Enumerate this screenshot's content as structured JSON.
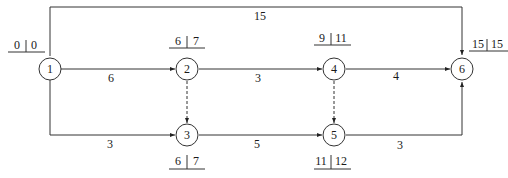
{
  "diagram": {
    "type": "activity-on-arrow network",
    "nodes": [
      {
        "id": "1",
        "label": "1",
        "x": 50,
        "y": 69,
        "es": "0",
        "ls": "0",
        "time_pos": "above-left"
      },
      {
        "id": "2",
        "label": "2",
        "x": 187,
        "y": 69,
        "es": "6",
        "ls": "7",
        "time_pos": "above"
      },
      {
        "id": "3",
        "label": "3",
        "x": 187,
        "y": 135,
        "es": "6",
        "ls": "7",
        "time_pos": "below"
      },
      {
        "id": "4",
        "label": "4",
        "x": 334,
        "y": 69,
        "es": "9",
        "ls": "11",
        "time_pos": "above"
      },
      {
        "id": "5",
        "label": "5",
        "x": 334,
        "y": 135,
        "es": "11",
        "ls": "12",
        "time_pos": "below"
      },
      {
        "id": "6",
        "label": "6",
        "x": 462,
        "y": 69,
        "es": "15",
        "ls": "15",
        "time_pos": "above-right"
      }
    ],
    "edges": [
      {
        "from": "1",
        "to": "2",
        "duration": "6",
        "dashed": false
      },
      {
        "from": "1",
        "to": "3",
        "duration": "3",
        "dashed": false
      },
      {
        "from": "1",
        "to": "6",
        "duration": "15",
        "dashed": false
      },
      {
        "from": "2",
        "to": "4",
        "duration": "3",
        "dashed": false
      },
      {
        "from": "2",
        "to": "3",
        "duration": "",
        "dashed": true
      },
      {
        "from": "3",
        "to": "5",
        "duration": "5",
        "dashed": false
      },
      {
        "from": "4",
        "to": "6",
        "duration": "4",
        "dashed": false
      },
      {
        "from": "4",
        "to": "5",
        "duration": "",
        "dashed": true
      },
      {
        "from": "5",
        "to": "6",
        "duration": "3",
        "dashed": false
      }
    ]
  },
  "labels": {
    "n1": "1",
    "n2": "2",
    "n3": "3",
    "n4": "4",
    "n5": "5",
    "n6": "6",
    "e12": "6",
    "e13": "3",
    "e16": "15",
    "e24": "3",
    "e35": "5",
    "e46": "4",
    "e56": "3",
    "t1a": "0",
    "t1b": "0",
    "t2a": "6",
    "t2b": "7",
    "t3a": "6",
    "t3b": "7",
    "t4a": "9",
    "t4b": "11",
    "t5a": "11",
    "t5b": "12",
    "t6a": "15",
    "t6b": "15"
  }
}
